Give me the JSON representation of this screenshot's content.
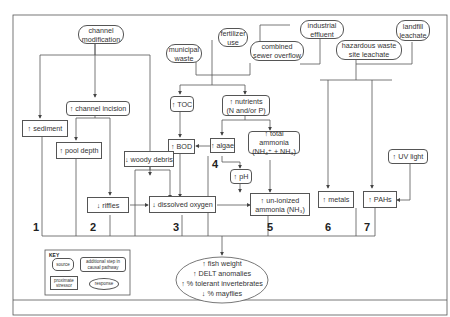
{
  "sources": {
    "channel_modification": "channel\nmodification",
    "municipal_waste": "municipal\nwaste",
    "fertilizer_use": "fertilizer\nuse",
    "industrial_effluent": "industrial\neffluent",
    "combined_sewer_overflow": "combined\nsewer overflow",
    "hazardous_waste": "hazardous waste\nsite leachate",
    "landfill_leachate": "landfill\nleachate"
  },
  "steps": {
    "channel_incision": "↑ channel incision",
    "toc": "↑ TOC",
    "nutrients": "↑ nutrients\n(N and/or P)",
    "bod": "↑ BOD",
    "algae": "↑ algae",
    "total_ammonia": "↑ total ammonia\n(NH₄⁺ + NH₃)",
    "ph": "↑ pH",
    "uv_light": "↑ UV light"
  },
  "stressors": {
    "sediment": "↑ sediment",
    "pool_depth": "↑ pool depth",
    "woody_debris": "↓ woody debris",
    "riffles": "↓ riffles",
    "dissolved_oxygen": "↓ dissolved oxygen",
    "unionized_ammonia": "↑ un-ionized\nammonia (NH₃)",
    "metals": "↑ metals",
    "pahs": "↑ PAHs"
  },
  "pathway_numbers": [
    "1",
    "2",
    "3",
    "4",
    "5",
    "6",
    "7"
  ],
  "responses": [
    "↑ fish weight",
    "↑ DELT anomalies",
    "↑ % tolerant invertebrates",
    "↓ % mayflies"
  ],
  "key": {
    "title": "KEY",
    "source": "source",
    "additional_step": "additional step in\ncausal pathway",
    "proximate_stressor": "proximate\nstressor",
    "response": "response"
  }
}
